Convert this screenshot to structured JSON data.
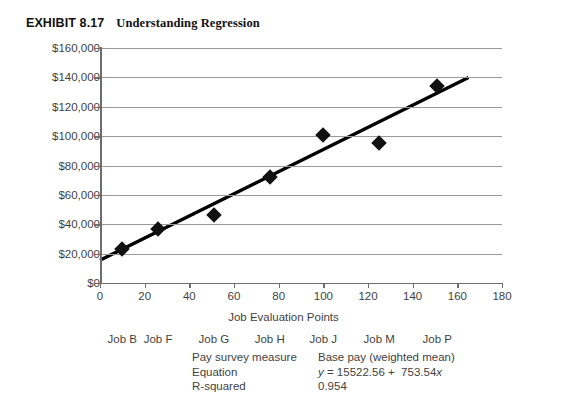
{
  "exhibit": {
    "number": "EXHIBIT 8.17",
    "title": "Understanding Regression"
  },
  "chart_data": {
    "type": "scatter",
    "title": "Understanding Regression",
    "xlabel": "Job Evaluation Points",
    "ylabel": "Base Pay",
    "xlim": [
      0,
      180
    ],
    "ylim": [
      0,
      160000
    ],
    "xticks": [
      "0",
      "20",
      "40",
      "60",
      "80",
      "100",
      "120",
      "140",
      "160",
      "180"
    ],
    "xtick_values": [
      0,
      20,
      40,
      60,
      80,
      100,
      120,
      140,
      160,
      180
    ],
    "yticks": [
      "$0",
      "$20,000",
      "$40,000",
      "$60,000",
      "$80,000",
      "$100,000",
      "$120,000",
      "$140,000",
      "$160,000"
    ],
    "ytick_values": [
      0,
      20000,
      40000,
      60000,
      80000,
      100000,
      120000,
      140000,
      160000
    ],
    "grid": true,
    "legend": "none",
    "point_labels": [
      "Job B",
      "Job F",
      "Job G",
      "Job H",
      "Job J",
      "Job M",
      "Job P"
    ],
    "points": [
      {
        "label": "Job B",
        "x": 10,
        "y": 23000
      },
      {
        "label": "Job F",
        "x": 26,
        "y": 37000
      },
      {
        "label": "Job G",
        "x": 51,
        "y": 46000
      },
      {
        "label": "Job H",
        "x": 76,
        "y": 72000
      },
      {
        "label": "Job J",
        "x": 100,
        "y": 101000
      },
      {
        "label": "Job M",
        "x": 125,
        "y": 95000
      },
      {
        "label": "Job P",
        "x": 151,
        "y": 134000
      }
    ],
    "trendline": {
      "intercept": 15522.56,
      "slope": 753.54,
      "x_start": 0,
      "x_end": 165,
      "color": "#000000"
    },
    "job_label_positions": [
      10,
      26,
      51,
      76,
      100,
      125,
      151
    ],
    "marker_color": "#111111",
    "gridline_color": "#9a9a9a"
  },
  "stats": {
    "rows": [
      {
        "label": "Pay survey measure",
        "value": "Base pay (weighted mean)"
      },
      {
        "label": "Equation",
        "value": "y = 15522.56 +  753.54x"
      },
      {
        "label": "R-squared",
        "value": "0.954"
      }
    ]
  }
}
